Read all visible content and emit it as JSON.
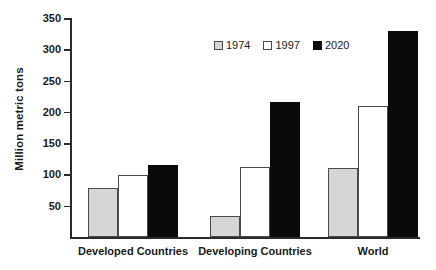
{
  "chart_data": {
    "type": "bar",
    "title": "",
    "xlabel": "",
    "ylabel": "Million metric tons",
    "categories": [
      "Developed Countries",
      "Developing Countries",
      "World"
    ],
    "series": [
      {
        "name": "1974",
        "color": "#d6d6d6",
        "values": [
          78,
          34,
          110
        ]
      },
      {
        "name": "1997",
        "color": "#ffffff",
        "values": [
          99,
          112,
          209
        ]
      },
      {
        "name": "2020",
        "color": "#0a0a0a",
        "values": [
          115,
          215,
          330
        ]
      }
    ],
    "ylim": [
      0,
      350
    ],
    "yticks": [
      50,
      100,
      150,
      200,
      250,
      300,
      350
    ],
    "ytick_labels": [
      "50",
      "100",
      "150",
      "200",
      "250",
      "300",
      "350"
    ],
    "grid": false,
    "legend_position": "top-center"
  }
}
